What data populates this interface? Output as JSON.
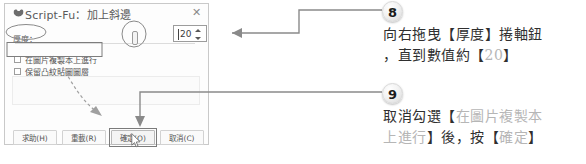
{
  "dialog": {
    "title": "Script-Fu：加上斜邊",
    "wilber_icon": "gimp-wilber-icon",
    "close_label": "✕",
    "thickness_label": "厚度：",
    "checkboxes": [
      {
        "label": "在圖片複製本上進行",
        "checked": false
      },
      {
        "label": "保留凸紋貼圖圖層",
        "checked": false
      }
    ],
    "buttons": [
      {
        "label": "求助(H)",
        "name": "help-button"
      },
      {
        "label": "重載(R)",
        "name": "reload-button"
      },
      {
        "label": "確定(O)",
        "name": "ok-button"
      },
      {
        "label": "取消(C)",
        "name": "cancel-button"
      }
    ]
  },
  "spinner": {
    "value": "20",
    "up_icon": "spin-up-arrow-icon",
    "down_icon": "spin-down-arrow-icon"
  },
  "steps": [
    {
      "number": "8",
      "line1_a": "向右拖曳【厚度】捲軸鈕",
      "line2_a": "，直到數值約【",
      "line2_dim": "20",
      "line2_b": "】"
    },
    {
      "number": "9",
      "line1_a": "取消勾選【",
      "line1_dim": "在圖片複製本",
      "line2_dim": "上進行",
      "line2_a": "】後，按【",
      "line2_dim2": "確定",
      "line2_b": "】"
    }
  ],
  "colors": {
    "annotation_line": "#8a8a8a",
    "dashed_arrow": "#9a9a9a",
    "text": "#2f2f2f",
    "dim_text": "#b6b6b6",
    "dialog_border": "#c9c9c9"
  }
}
